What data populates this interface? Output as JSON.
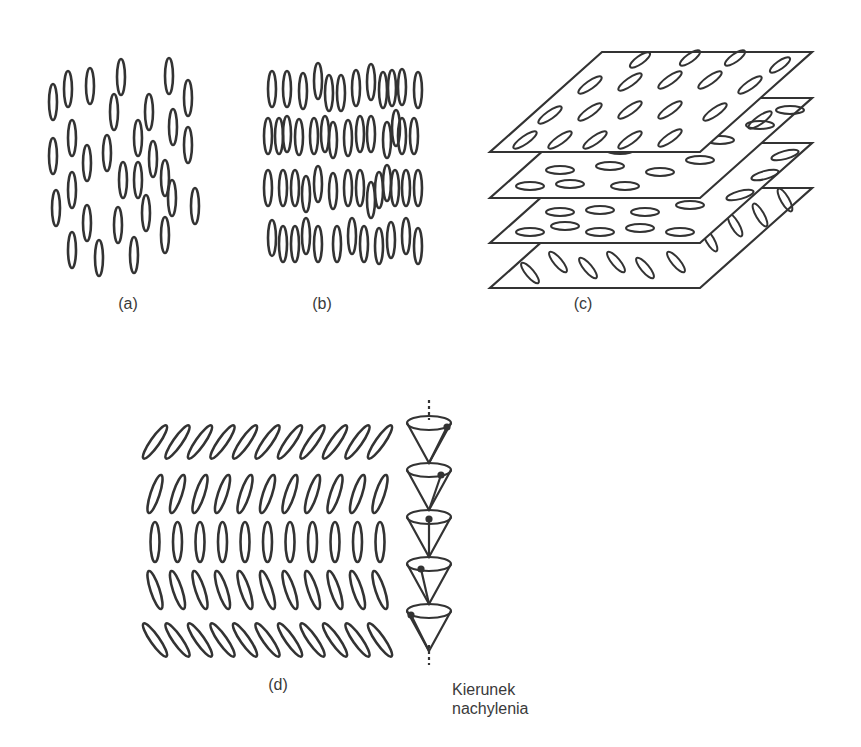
{
  "figure": {
    "panels": [
      {
        "id": "a",
        "label": "(a)",
        "description": "nematic phase - randomly positioned, oriented rod-like molecules"
      },
      {
        "id": "b",
        "label": "(b)",
        "description": "smectic phase - molecules arranged in layers"
      },
      {
        "id": "c",
        "label": "(c)",
        "description": "cholesteric phase - stacked layers with rotating director"
      },
      {
        "id": "d",
        "label": "(d)",
        "description": "chiral smectic C - tilted layers with precessing tilt cone"
      }
    ],
    "annotation": {
      "line1": "Kierunek",
      "line2": "nachylenia"
    },
    "colors": {
      "stroke": "#333333",
      "background": "#ffffff"
    }
  }
}
